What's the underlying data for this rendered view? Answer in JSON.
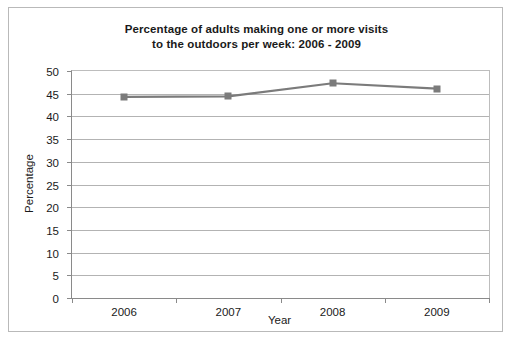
{
  "chart_data": {
    "type": "line",
    "title": "Percentage of adults making one or more visits to the outdoors per week: 2006 - 2009",
    "title_lines": [
      "Percentage of adults making one or more visits",
      "to the outdoors per week: 2006 - 2009"
    ],
    "xlabel": "Year",
    "ylabel": "Percentage",
    "categories": [
      "2006",
      "2007",
      "2008",
      "2009"
    ],
    "values": [
      44.3,
      44.4,
      47.3,
      46.1
    ],
    "series": [
      {
        "name": "Percentage of adults making one or more visits to the outdoors per week",
        "values": [
          44.3,
          44.4,
          47.3,
          46.1
        ]
      }
    ],
    "ylim": [
      0,
      50
    ],
    "ytick_values": [
      50,
      45,
      40,
      35,
      30,
      25,
      20,
      15,
      10,
      5,
      0
    ],
    "ytick_labels": [
      "50",
      "45",
      "40",
      "35",
      "30",
      "25",
      "20",
      "15",
      "10",
      "5",
      "0"
    ],
    "xtick_labels": [
      "2006",
      "2007",
      "2008",
      "2009"
    ],
    "grid": "horizontal",
    "legend": "none",
    "line_color": "#7b7b7b",
    "marker_color": "#7b7b7b",
    "marker_shape": "square",
    "gridline_color": "#b3b3b3",
    "axis_color": "#8a8a8a",
    "border_color": "#b9b9b9",
    "background_color": "#ffffff",
    "text_color": "#1a1a1a"
  }
}
